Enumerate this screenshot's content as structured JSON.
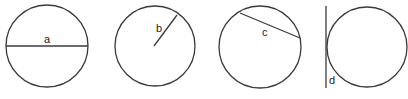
{
  "diagram": {
    "title": "",
    "stroke_color": "#3a3a3a",
    "background": "#ffffff",
    "figures": [
      {
        "id": "a",
        "label": "a",
        "concept": "diameter",
        "circle": {
          "cx": 47,
          "cy": 46,
          "r": 41
        },
        "line": {
          "x1": 6,
          "y1": 46,
          "x2": 88,
          "y2": 46
        },
        "label_pos": {
          "x": 44,
          "y": 43
        }
      },
      {
        "id": "b",
        "label": "b",
        "concept": "radius",
        "circle": {
          "cx": 155,
          "cy": 46,
          "r": 40
        },
        "line": {
          "x1": 154,
          "y1": 46,
          "x2": 177,
          "y2": 15
        },
        "label_pos": {
          "x": 156,
          "y": 32
        }
      },
      {
        "id": "c",
        "label": "c",
        "concept": "chord",
        "circle": {
          "cx": 260,
          "cy": 47,
          "r": 41
        },
        "line": {
          "x1": 240,
          "y1": 13,
          "x2": 300,
          "y2": 38
        },
        "label_pos": {
          "x": 262,
          "y": 36
        }
      },
      {
        "id": "d",
        "label": "d",
        "concept": "tangent",
        "circle": {
          "cx": 367,
          "cy": 47,
          "r": 40
        },
        "line": {
          "x1": 326,
          "y1": 6,
          "x2": 326,
          "y2": 88
        },
        "label_pos": {
          "x": 329,
          "y": 84
        }
      }
    ]
  }
}
